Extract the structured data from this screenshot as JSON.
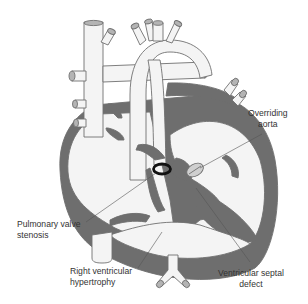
{
  "diagram": {
    "colors": {
      "background": "#ffffff",
      "vessel_fill": "#f4f4f4",
      "outline": "#707070",
      "muscle": "#6e6e6e",
      "vessel_end": "#b4b4b4",
      "valve_ring": "#111111",
      "label_text": "#333333",
      "leader_line": "#555555"
    },
    "labels": [
      {
        "id": "overriding-aorta",
        "lines": [
          "Overriding",
          "aorta"
        ]
      },
      {
        "id": "pulmonary-valve-stenosis",
        "lines": [
          "Pulmonary valve",
          "stenosis"
        ]
      },
      {
        "id": "right-ventricular-hypertrophy",
        "lines": [
          "Right ventricular",
          "hypertrophy"
        ]
      },
      {
        "id": "ventricular-septal-defect",
        "lines": [
          "Ventricular septal",
          "defect"
        ]
      }
    ]
  }
}
